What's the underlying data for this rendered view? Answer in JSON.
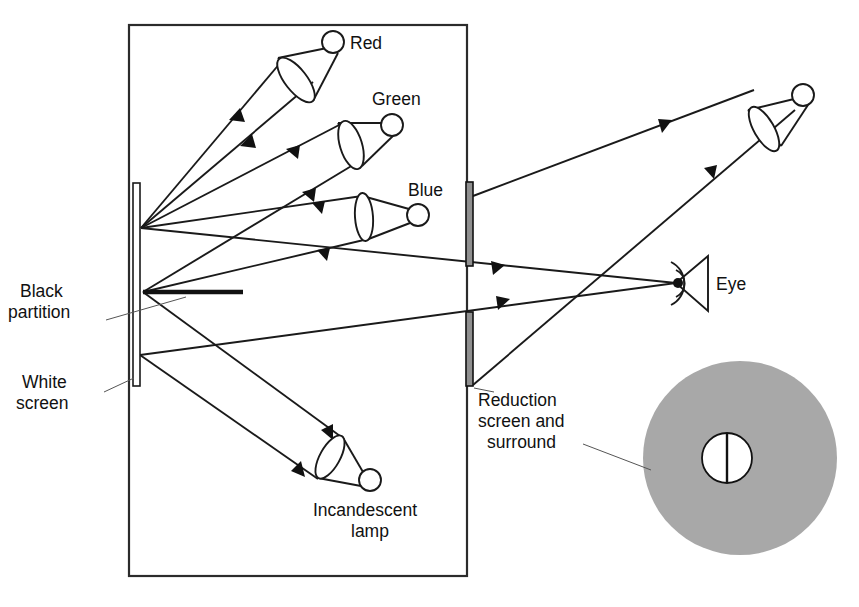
{
  "figure": {
    "background_color": "#ffffff",
    "line_color": "#1a1a1a",
    "surround_color": "#a8a8a8",
    "width": 859,
    "height": 607
  },
  "labels": {
    "red_lamp": "Red",
    "green_lamp": "Green",
    "blue_lamp": "Blue",
    "eye": "Eye",
    "black_partition_line1": "Black",
    "black_partition_line2": "partition",
    "white_screen_line1": "White",
    "white_screen_line2": "screen",
    "reduction_line1": "Reduction",
    "reduction_line2": "screen and",
    "reduction_line3": "surround",
    "incandescent_line1": "Incandescent",
    "incandescent_line2": "lamp"
  },
  "components": {
    "enclosure": {
      "name": "viewing-box",
      "x": 129,
      "y": 25,
      "width": 338,
      "height": 551
    },
    "white_screen": {
      "x": 133,
      "y": 183,
      "width": 7,
      "height": 203
    },
    "black_partition": {
      "x1": 143,
      "y1": 292,
      "x2": 243,
      "y2": 292
    },
    "reduction_screen_upper": {
      "x": 466,
      "y": 182,
      "width": 7,
      "height": 84
    },
    "reduction_screen_lower": {
      "x": 466,
      "y": 312,
      "width": 7,
      "height": 74
    },
    "lamps": [
      {
        "name": "red-lamp",
        "bulb_x": 333,
        "bulb_y": 42,
        "bulb_r": 11
      },
      {
        "name": "green-lamp",
        "bulb_x": 392,
        "bulb_y": 125,
        "bulb_r": 11
      },
      {
        "name": "blue-lamp",
        "bulb_x": 418,
        "bulb_y": 215,
        "bulb_r": 11
      },
      {
        "name": "incandescent-lamp",
        "bulb_x": 370,
        "bulb_y": 480,
        "bulb_r": 11
      },
      {
        "name": "outer-lamp",
        "bulb_x": 803,
        "bulb_y": 95,
        "bulb_r": 11
      }
    ],
    "eye": {
      "x": 676,
      "y": 283
    },
    "surround_disc": {
      "cx": 740,
      "cy": 458,
      "r": 97
    },
    "inner_disc": {
      "cx": 727,
      "cy": 458,
      "r": 25
    }
  },
  "ray_convergence_points": {
    "upper_screen_point": {
      "x": 141,
      "y": 228
    },
    "lower_screen_point": {
      "x": 143,
      "y": 292
    },
    "eye_point": {
      "x": 676,
      "y": 283
    }
  }
}
